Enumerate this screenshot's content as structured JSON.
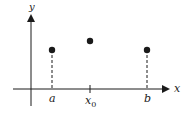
{
  "axes": {
    "x_label": "x",
    "y_label": "y"
  },
  "ticks": [
    {
      "label": "a",
      "x": 52
    },
    {
      "label": "x",
      "sub": "0",
      "x": 90
    },
    {
      "label": "b",
      "x": 147
    }
  ],
  "points": [
    {
      "name": "a",
      "x": 52,
      "y": 50,
      "dashed_drop": true
    },
    {
      "name": "x0",
      "x": 90,
      "y": 41,
      "dashed_drop": false
    },
    {
      "name": "b",
      "x": 147,
      "y": 50,
      "dashed_drop": true
    }
  ],
  "colors": {
    "ink": "#1a1a1a",
    "background": "#ffffff"
  }
}
